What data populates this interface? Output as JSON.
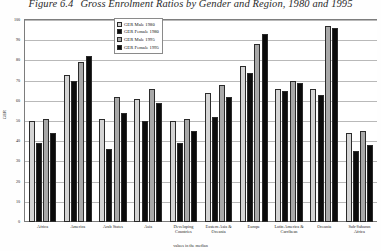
{
  "figure": {
    "number": "Figure 6.4",
    "title": "Gross Enrolment Ratios by Gender and Region, 1980 and 1995"
  },
  "legend": {
    "position": "top-center-inside",
    "entries": [
      {
        "label": "GER Male 1980",
        "color": "#d4d4d4"
      },
      {
        "label": "GER Female 1980",
        "color": "#0d0d0d"
      },
      {
        "label": "GER Male 1995",
        "color": "#a8a8a8"
      },
      {
        "label": "GER Female 1995",
        "color": "#0a0a0a"
      }
    ]
  },
  "axes": {
    "y_title": "GER",
    "y_ticks": [
      "100",
      "90",
      "80",
      "70",
      "60",
      "50",
      "40",
      "30",
      "20",
      "10",
      "0"
    ],
    "x_title": "values in the median"
  },
  "chart_data": {
    "type": "bar",
    "title": "Gross Enrolment Ratios by Gender and Region, 1980 and 1995",
    "xlabel": "values in the median",
    "ylabel": "GER",
    "ylim": [
      0,
      100
    ],
    "grid": true,
    "legend_position": "top-center",
    "categories": [
      "Africa",
      "America",
      "Arab States",
      "Asia",
      "Developing Countries",
      "Eastern Asia & Oceania",
      "Europe",
      "Latin America & Carribean",
      "Oceania",
      "Sub-Saharan Africa"
    ],
    "series": [
      {
        "name": "GER Male 1980",
        "color": "#d4d4d4",
        "values": [
          50,
          73,
          51,
          61,
          50,
          64,
          77,
          66,
          66,
          44
        ]
      },
      {
        "name": "GER Female 1980",
        "color": "#0d0d0d",
        "values": [
          39,
          70,
          36,
          50,
          39,
          52,
          74,
          65,
          63,
          35
        ]
      },
      {
        "name": "GER Male 1995",
        "color": "#a8a8a8",
        "values": [
          51,
          79,
          62,
          66,
          51,
          68,
          88,
          70,
          97,
          45
        ]
      },
      {
        "name": "GER Female 1995",
        "color": "#0a0a0a",
        "values": [
          44,
          82,
          54,
          59,
          45,
          62,
          93,
          69,
          96,
          38
        ]
      }
    ]
  }
}
